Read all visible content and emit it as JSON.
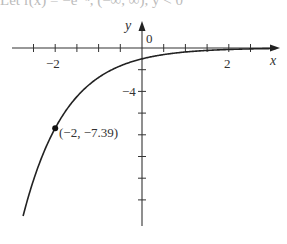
{
  "header_fragment": "Let f(x) = −e⁻ˣ, (−∞, ∞), y < 0",
  "chart_data": {
    "type": "line",
    "title": "",
    "function": "y = -e^(-x)",
    "xlabel": "x",
    "ylabel": "y",
    "xlim": [
      -3.3,
      3.1
    ],
    "ylim": [
      -15.9,
      1.5
    ],
    "x_tick_step": 0.5,
    "y_tick_step": 2,
    "x_tick_labels": [
      {
        "value": -2,
        "text": "−2"
      },
      {
        "value": 2,
        "text": "2"
      }
    ],
    "y_tick_labels": [
      {
        "value": -4,
        "text": "−4"
      }
    ],
    "origin_label": "0",
    "grid": false,
    "series": [
      {
        "name": "y = -e^(-x)",
        "x": [
          -2.74,
          -2.5,
          -2,
          -1.5,
          -1,
          -0.5,
          0,
          0.5,
          1,
          1.5,
          2,
          2.5,
          3
        ],
        "values": [
          -15.49,
          -12.18,
          -7.39,
          -4.48,
          -2.72,
          -1.65,
          -1,
          -0.61,
          -0.37,
          -0.22,
          -0.14,
          -0.08,
          -0.05
        ]
      }
    ],
    "annotations": [
      {
        "x": -2,
        "y": -7.39,
        "text": "(−2, −7.39)",
        "marker": "filled-dot"
      }
    ]
  },
  "labels": {
    "x_axis": "x",
    "y_axis": "y",
    "origin": "0",
    "tick_neg2": "−2",
    "tick_pos2": "2",
    "tick_neg4": "−4",
    "point": "(−2, −7.39)"
  }
}
